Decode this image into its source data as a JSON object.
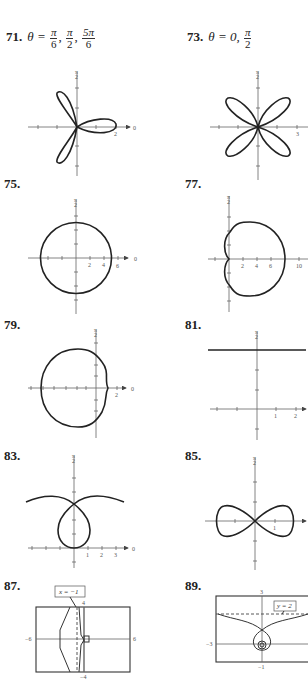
{
  "page": {
    "type": "textbook answer key",
    "topic": "Polar graphs"
  },
  "problems": [
    {
      "number": "71.",
      "answer_prefix": "θ =",
      "answer_fracs": [
        [
          "π",
          "6"
        ],
        [
          "π",
          "2"
        ],
        [
          "5π",
          "6"
        ]
      ],
      "graph": {
        "type": "rose",
        "petals": 3,
        "axis_label_angle": "π/2",
        "polar_axis_label": "0",
        "tick_labels": [
          "2"
        ]
      }
    },
    {
      "number": "73.",
      "answer_prefix": "θ = 0,",
      "answer_fracs": [
        [
          "π",
          "2"
        ]
      ],
      "graph": {
        "type": "rose",
        "petals": 4,
        "axis_label_angle": "π/2",
        "tick_labels": [
          "3"
        ]
      }
    },
    {
      "number": "75.",
      "graph": {
        "type": "circle",
        "axis_label_angle": "π/2",
        "polar_axis_label": "0",
        "tick_labels": [
          "2",
          "4",
          "6"
        ]
      }
    },
    {
      "number": "77.",
      "graph": {
        "type": "limacon-dimpled",
        "axis_label_angle": "π/2",
        "tick_labels": [
          "2",
          "4",
          "6",
          "10"
        ]
      }
    },
    {
      "number": "79.",
      "graph": {
        "type": "limacon-dimpled-left",
        "axis_label_angle": "π/2",
        "polar_axis_label": "0",
        "tick_labels": [
          "2"
        ]
      }
    },
    {
      "number": "81.",
      "graph": {
        "type": "horizontal-line",
        "axis_label_angle": "π/2",
        "tick_labels": [
          "1",
          "2"
        ]
      }
    },
    {
      "number": "83.",
      "graph": {
        "type": "conchoid",
        "axis_label_angle": "π/2",
        "polar_axis_label": "0",
        "tick_labels": [
          "1",
          "2",
          "3"
        ]
      }
    },
    {
      "number": "85.",
      "graph": {
        "type": "lemniscate",
        "axis_label_angle": "π/2",
        "tick_labels": [
          "1"
        ]
      }
    },
    {
      "number": "87.",
      "graph": {
        "type": "calculator",
        "window": {
          "xmin": "-6",
          "xmax": "6",
          "ymin": "-4",
          "ymax": "4"
        },
        "asymptote": "x = −1"
      }
    },
    {
      "number": "89.",
      "graph": {
        "type": "calculator",
        "window": {
          "xmin": "-3",
          "ymin": "-1",
          "ymax": "3"
        },
        "asymptote": "y = 2"
      }
    }
  ],
  "labels": {
    "pi_over_2": "π",
    "pi_den": "2",
    "zero": "0",
    "t2": "2",
    "t3": "3",
    "t4": "4",
    "t6": "6",
    "t10": "10",
    "t1": "1",
    "w87_xmin": "−6",
    "w87_xmax": "6",
    "w87_ymax": "4",
    "w87_ymin": "−4",
    "w87_asym": "x = −1",
    "w89_xmin": "−3",
    "w89_ymax": "3",
    "w89_ymin": "−1",
    "w89_asym": "y = 2"
  }
}
